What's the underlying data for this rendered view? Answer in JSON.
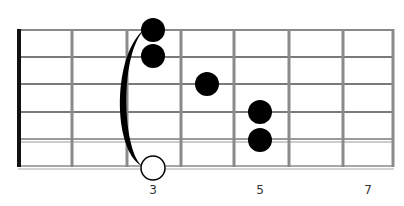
{
  "diagram": {
    "type": "guitar-chord-fretboard",
    "orientation": "horizontal",
    "strings": 6,
    "frets_shown": 7,
    "colors": {
      "background": "#ffffff",
      "nut": "#111111",
      "fret": "#8a8a8a",
      "string": "#7a7a7a",
      "dot": "#000000",
      "open_circle_fill": "#ffffff",
      "open_circle_stroke": "#000000",
      "barre": "#000000",
      "label": "#333333"
    },
    "fret_labels": [
      {
        "fret": 3,
        "text": "3"
      },
      {
        "fret": 5,
        "text": "5"
      },
      {
        "fret": 7,
        "text": "7"
      }
    ],
    "dots": [
      {
        "string": 1,
        "fret": 3,
        "type": "filled"
      },
      {
        "string": 2,
        "fret": 3,
        "type": "filled"
      },
      {
        "string": 3,
        "fret": 4,
        "type": "filled"
      },
      {
        "string": 4,
        "fret": 5,
        "type": "filled"
      },
      {
        "string": 5,
        "fret": 5,
        "type": "filled"
      },
      {
        "string": 6,
        "fret": 3,
        "type": "open"
      }
    ],
    "barre": {
      "fret": 3,
      "from_string": 1,
      "to_string": 6
    }
  }
}
